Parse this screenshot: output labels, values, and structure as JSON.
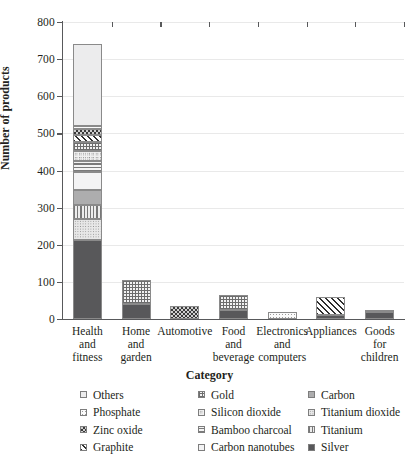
{
  "chart_data": {
    "type": "bar",
    "stacked": true,
    "title": "",
    "xlabel": "Category",
    "ylabel": "Number of products",
    "ylim": [
      0,
      800
    ],
    "ytick_step": 100,
    "yticks": [
      "0",
      "100",
      "200",
      "300",
      "400",
      "500",
      "600",
      "700",
      "800"
    ],
    "grid": true,
    "legend_position": "bottom",
    "legend_columns": 3,
    "categories": [
      "Health and fitness",
      "Home and garden",
      "Automotive",
      "Food and beverage",
      "Electronics and computers",
      "Appliances",
      "Goods for children"
    ],
    "category_lines": [
      [
        "Health",
        "and",
        "fitness"
      ],
      [
        "Home",
        "and",
        "garden"
      ],
      [
        "Automotive",
        "",
        ""
      ],
      [
        "Food",
        "and",
        "beverage"
      ],
      [
        "Electronics",
        "and",
        "computers"
      ],
      [
        "Appliances",
        "",
        ""
      ],
      [
        "Goods",
        "for",
        "children"
      ]
    ],
    "totals": [
      740,
      105,
      35,
      65,
      20,
      60,
      20
    ],
    "series": [
      {
        "name": "Silver",
        "pattern": "p-silver",
        "values": [
          213,
          40,
          0,
          25,
          0,
          12,
          18
        ]
      },
      {
        "name": "Titanium dioxide",
        "pattern": "p-tio2",
        "values": [
          57,
          0,
          0,
          0,
          0,
          0,
          0
        ]
      },
      {
        "name": "Titanium",
        "pattern": "p-titanium",
        "values": [
          38,
          0,
          0,
          0,
          0,
          0,
          0
        ]
      },
      {
        "name": "Carbon",
        "pattern": "p-carbon",
        "values": [
          40,
          0,
          0,
          0,
          0,
          0,
          0
        ]
      },
      {
        "name": "Carbon nanotubes",
        "pattern": "p-cnt",
        "values": [
          47,
          0,
          0,
          0,
          0,
          0,
          0
        ]
      },
      {
        "name": "Bamboo charcoal",
        "pattern": "p-bamboo",
        "values": [
          31,
          0,
          0,
          0,
          0,
          0,
          0
        ]
      },
      {
        "name": "Silicon dioxide",
        "pattern": "p-silicon",
        "values": [
          26,
          0,
          0,
          0,
          0,
          0,
          0
        ]
      },
      {
        "name": "Gold",
        "pattern": "p-gold",
        "values": [
          24,
          65,
          0,
          40,
          0,
          0,
          0
        ]
      },
      {
        "name": "Graphite",
        "pattern": "p-graphite",
        "values": [
          20,
          0,
          0,
          0,
          0,
          48,
          0
        ]
      },
      {
        "name": "Zinc oxide",
        "pattern": "p-zinc",
        "values": [
          16,
          0,
          35,
          0,
          0,
          0,
          2
        ]
      },
      {
        "name": "Phosphate",
        "pattern": "p-phosphate",
        "values": [
          8,
          0,
          0,
          0,
          20,
          0,
          0
        ]
      },
      {
        "name": "Others",
        "pattern": "p-others",
        "values": [
          220,
          0,
          0,
          0,
          0,
          0,
          0
        ]
      }
    ],
    "legend": [
      {
        "label": "Others",
        "pattern": "p-others"
      },
      {
        "label": "Phosphate",
        "pattern": "p-phosphate"
      },
      {
        "label": "Zinc oxide",
        "pattern": "p-zinc"
      },
      {
        "label": "Graphite",
        "pattern": "p-graphite"
      },
      {
        "label": "Gold",
        "pattern": "p-gold"
      },
      {
        "label": "Silicon dioxide",
        "pattern": "p-silicon"
      },
      {
        "label": "Bamboo charcoal",
        "pattern": "p-bamboo"
      },
      {
        "label": "Carbon nanotubes",
        "pattern": "p-cnt"
      },
      {
        "label": "Carbon",
        "pattern": "p-carbon"
      },
      {
        "label": "Titanium dioxide",
        "pattern": "p-tio2"
      },
      {
        "label": "Titanium",
        "pattern": "p-titanium"
      },
      {
        "label": "Silver",
        "pattern": "p-silver"
      }
    ]
  }
}
